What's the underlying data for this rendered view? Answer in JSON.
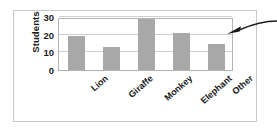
{
  "figure": {
    "border_color": "#c9c9c9",
    "background": "#ffffff"
  },
  "chart_data": {
    "type": "bar",
    "title": "",
    "xlabel": "",
    "ylabel": "Students",
    "categories": [
      "Lion",
      "Giraffe",
      "Monkey",
      "Elephant",
      "Other"
    ],
    "values": [
      19,
      13,
      29,
      21,
      15
    ],
    "ylim": [
      0,
      30
    ],
    "yticks": [
      0,
      10,
      20,
      30
    ],
    "ytick_labels": [
      "0",
      "10",
      "20",
      "30"
    ],
    "grid": true,
    "gridlines_at": [
      10,
      20,
      30
    ],
    "legend": null,
    "bar_color": "#a8a8a8",
    "gridline_color": "#cfcfcf",
    "axis_color": "#b5b5b5",
    "xtick_rotation_degrees": -41,
    "annotations": [
      {
        "name": "pointer-arrow",
        "shape": "curved-arrow",
        "points_to": "plot-area-upper-right",
        "color": "#1b1b1b",
        "text": ""
      }
    ]
  }
}
